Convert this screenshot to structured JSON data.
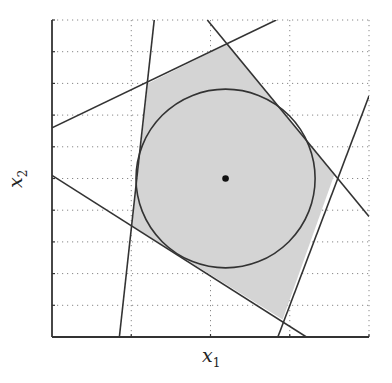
{
  "chart_data": {
    "type": "diagram",
    "title": "",
    "xlabel": "x1",
    "ylabel": "x2",
    "xlabel_parts": {
      "base": "x",
      "sub": "1"
    },
    "ylabel_parts": {
      "base": "x",
      "sub": "2"
    },
    "grid": true,
    "grid_style": "dotted",
    "xlim": [
      0,
      4
    ],
    "ylim": [
      0,
      10
    ],
    "x_gridlines": [
      0,
      1,
      2,
      3,
      4
    ],
    "y_gridlines": [
      0,
      1,
      2,
      3,
      4,
      5,
      6,
      7,
      8,
      9,
      10
    ],
    "tick_labels_shown": false,
    "lines": [
      {
        "name": "line-a",
        "from": [
          0.0,
          6.6
        ],
        "to": [
          2.83,
          10.0
        ]
      },
      {
        "name": "line-b",
        "from": [
          1.29,
          10.0
        ],
        "to": [
          0.85,
          0.0
        ]
      },
      {
        "name": "line-c",
        "from": [
          0.0,
          5.1
        ],
        "to": [
          3.21,
          0.0
        ]
      },
      {
        "name": "line-d",
        "from": [
          1.96,
          10.0
        ],
        "to": [
          4.0,
          3.8
        ]
      },
      {
        "name": "line-e",
        "from": [
          2.85,
          0.0
        ],
        "to": [
          4.0,
          7.6
        ]
      }
    ],
    "feasible_polygon": [
      [
        1.21,
        8.0
      ],
      [
        2.22,
        9.25
      ],
      [
        3.56,
        5.1
      ],
      [
        2.91,
        0.55
      ],
      [
        1.01,
        3.5
      ]
    ],
    "fill_color": "#d4d4d4",
    "inscribed_circle": {
      "center": [
        2.19,
        5.0
      ],
      "radius_x": 1.13,
      "radius_y": 2.82
    },
    "center_point": [
      2.19,
      5.0
    ],
    "annotations": []
  },
  "colors": {
    "line": "#333333",
    "grid": "#888888",
    "fill": "#d4d4d4",
    "point": "#111111"
  }
}
